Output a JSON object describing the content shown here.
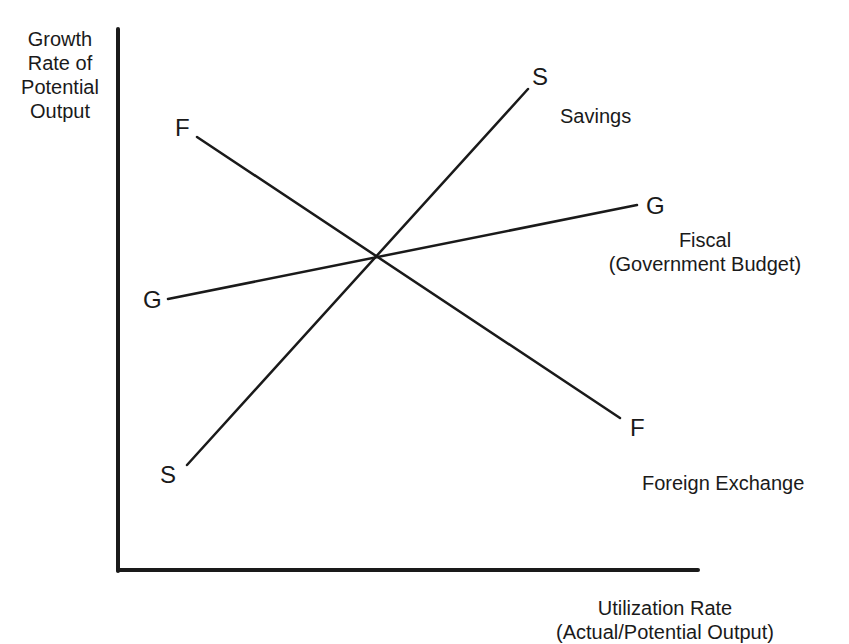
{
  "diagram": {
    "y_axis_label": [
      "Growth",
      "Rate of",
      "Potential",
      "Output"
    ],
    "x_axis_label": [
      "Utilization Rate",
      "(Actual/Potential Output)"
    ],
    "curves": [
      {
        "id": "savings",
        "start_letter": "S",
        "end_letter": "S",
        "name": "Savings",
        "slope": "upward-steep"
      },
      {
        "id": "fiscal",
        "start_letter": "G",
        "end_letter": "G",
        "name_lines": [
          "Fiscal",
          "(Government Budget)"
        ],
        "slope": "upward-shallow"
      },
      {
        "id": "foreign-exchange",
        "start_letter": "F",
        "end_letter": "F",
        "name": "Foreign Exchange",
        "slope": "downward"
      }
    ],
    "intersection": "all three curves cross at a single point",
    "line_color": "#1a1a1a",
    "background": "#ffffff"
  },
  "labels": {
    "s_top": "S",
    "s_bottom": "S",
    "savings": "Savings",
    "g_left": "G",
    "g_right": "G",
    "fiscal": "Fiscal",
    "fiscal_sub": "(Government Budget)",
    "f_top": "F",
    "f_bottom": "F",
    "foreign_exchange": "Foreign Exchange",
    "y0": "Growth",
    "y1": "Rate of",
    "y2": "Potential",
    "y3": "Output",
    "x0": "Utilization Rate",
    "x1": "(Actual/Potential Output)"
  }
}
